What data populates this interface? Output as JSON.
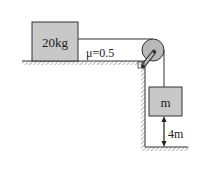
{
  "diagram": {
    "block_top": {
      "label": "20kg",
      "fill": "#c8c8c8"
    },
    "friction": {
      "label": "μ=0.5"
    },
    "block_hanging": {
      "label": "m",
      "fill": "#c8c8c8"
    },
    "height": {
      "label": "4m"
    },
    "colors": {
      "line": "#333333",
      "block_fill": "#c8c8c8",
      "pulley_fill": "#b8b8b8"
    }
  }
}
